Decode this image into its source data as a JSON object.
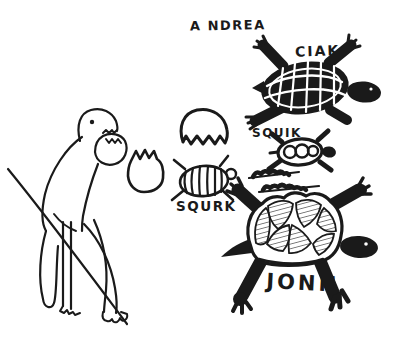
{
  "drawing": {
    "signature": "A NDREA",
    "labels": {
      "ciak": "CIAK",
      "squik": "SQUIK",
      "squrk": "SQURK",
      "jonn": "JONN"
    },
    "colors": {
      "ink": "#1a1a1a",
      "paper": "#ffffff"
    }
  }
}
